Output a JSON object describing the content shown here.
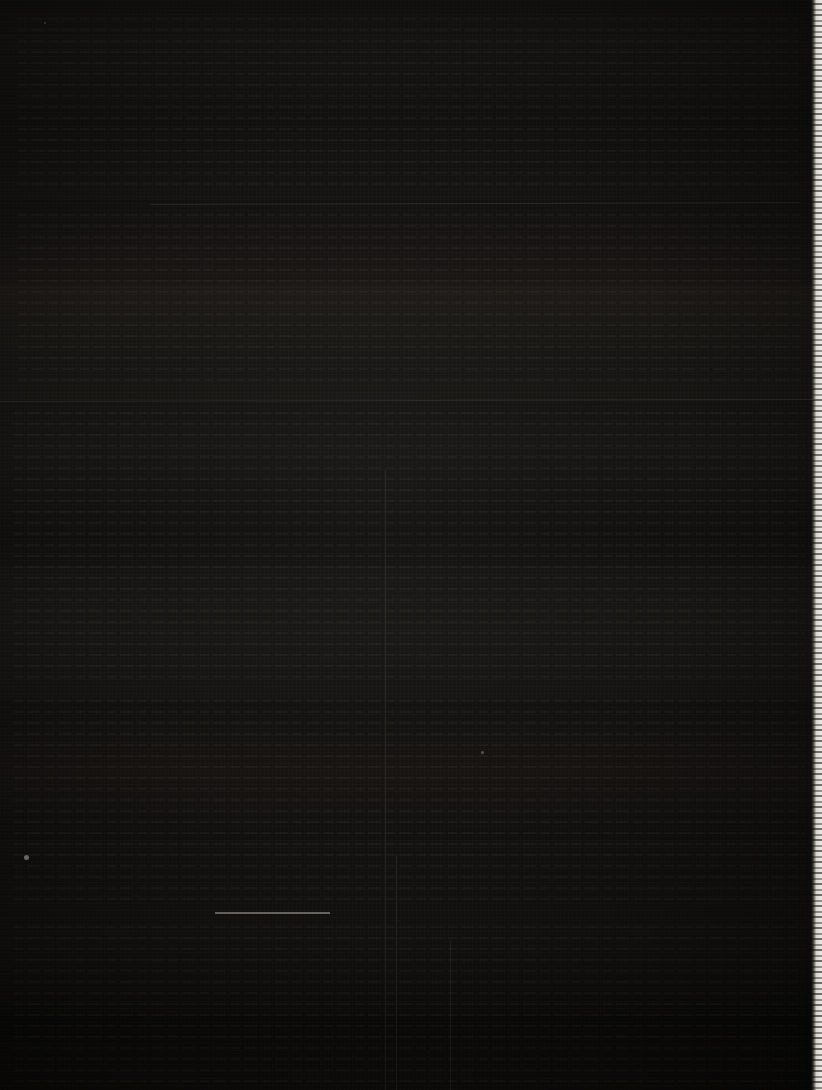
{
  "document": {
    "title": "",
    "description": "Severely underexposed scan of a document page; page content is not legible",
    "legible_text": "none",
    "background_color": "#070605",
    "page_tone_color": "#0c0a09",
    "page_edge_color": "#f0ece5",
    "rule_color": "#d6cec0",
    "width_px": 822,
    "height_px": 1090
  },
  "features": {
    "page_edge": {
      "name": "right-page-edge",
      "side": "right",
      "left_px": 811,
      "width_px": 11,
      "color": "#f0ece5"
    },
    "tone_bands": [
      {
        "top_px": 0,
        "height_px": 200,
        "level": "0.018"
      },
      {
        "top_px": 200,
        "height_px": 85,
        "level": "0.010"
      },
      {
        "top_px": 285,
        "height_px": 115,
        "level": "0.026"
      },
      {
        "top_px": 400,
        "height_px": 165,
        "level": "0.014"
      },
      {
        "top_px": 565,
        "height_px": 135,
        "level": "0.022"
      },
      {
        "top_px": 700,
        "height_px": 140,
        "level": "0.012"
      },
      {
        "top_px": 840,
        "height_px": 175,
        "level": "0.020"
      },
      {
        "top_px": 1015,
        "height_px": 75,
        "level": "0.009"
      }
    ],
    "horizontal_rules": [
      {
        "name": "rule-upper",
        "x_px": 150,
        "y_px": 203,
        "width_px": 650,
        "weight": "faint"
      },
      {
        "name": "rule-middle",
        "x_px": 0,
        "y_px": 400,
        "width_px": 816,
        "weight": "faint"
      },
      {
        "name": "rule-lower",
        "x_px": 215,
        "y_px": 912,
        "width_px": 115,
        "weight": "strong"
      }
    ],
    "vertical_rules": [
      {
        "name": "vrule-left",
        "x_px": 385,
        "y_px": 470,
        "height_px": 620
      },
      {
        "name": "vrule-center",
        "x_px": 396,
        "y_px": 855,
        "height_px": 235
      },
      {
        "name": "vrule-right",
        "x_px": 450,
        "y_px": 940,
        "height_px": 150
      }
    ],
    "specks": [
      {
        "name": "speck-left",
        "x_px": 24,
        "y_px": 855,
        "size_px": 5
      },
      {
        "name": "speck-center",
        "x_px": 481,
        "y_px": 751,
        "size_px": 3
      },
      {
        "name": "speck-top",
        "x_px": 44,
        "y_px": 22,
        "size_px": 2
      }
    ],
    "text_ghosts": [
      {
        "name": "text-ghost-top",
        "x_px": 18,
        "y_px": 18,
        "width_px": 780,
        "height_px": 170
      },
      {
        "name": "text-ghost-upper",
        "x_px": 18,
        "y_px": 214,
        "width_px": 782,
        "height_px": 175
      },
      {
        "name": "text-ghost-middle",
        "x_px": 14,
        "y_px": 412,
        "width_px": 790,
        "height_px": 270
      },
      {
        "name": "text-ghost-lower",
        "x_px": 14,
        "y_px": 700,
        "width_px": 790,
        "height_px": 200
      },
      {
        "name": "text-ghost-bottom",
        "x_px": 14,
        "y_px": 926,
        "width_px": 790,
        "height_px": 158
      }
    ]
  }
}
